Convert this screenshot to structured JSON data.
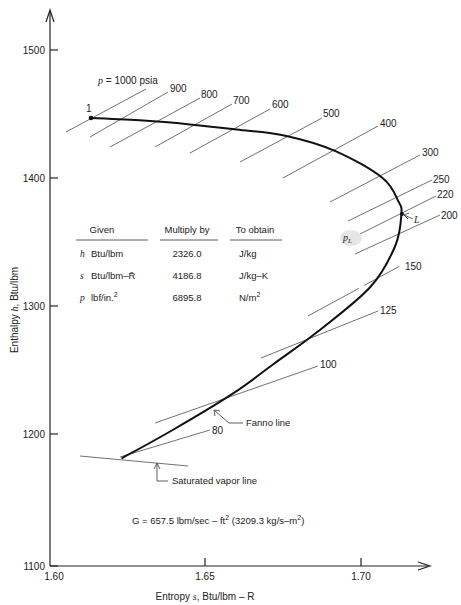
{
  "chart_data": {
    "type": "line",
    "title": "",
    "xlabel": "Entropy s, Btu/lbm – R",
    "ylabel": "Enthalpy h, Btu/lbm",
    "xlim": [
      1.6,
      1.72
    ],
    "ylim": [
      1100,
      1520
    ],
    "x_ticks": [
      1.6,
      1.65,
      1.7
    ],
    "x_tick_labels": [
      "1.60",
      "1.65",
      "1.70"
    ],
    "y_ticks": [
      1100,
      1200,
      1300,
      1400,
      1500
    ],
    "y_tick_labels": [
      "1100",
      "1200",
      "1300",
      "1400",
      "1500"
    ],
    "grid": false,
    "series": [
      {
        "name": "Fanno line",
        "points": [
          {
            "s": 1.613,
            "h": 1450
          },
          {
            "s": 1.63,
            "h": 1448
          },
          {
            "s": 1.645,
            "h": 1445
          },
          {
            "s": 1.66,
            "h": 1441
          },
          {
            "s": 1.676,
            "h": 1436
          },
          {
            "s": 1.692,
            "h": 1424
          },
          {
            "s": 1.707,
            "h": 1403
          },
          {
            "s": 1.712,
            "h": 1385
          },
          {
            "s": 1.713,
            "h": 1375
          },
          {
            "s": 1.711,
            "h": 1350
          },
          {
            "s": 1.703,
            "h": 1318
          },
          {
            "s": 1.686,
            "h": 1283
          },
          {
            "s": 1.672,
            "h": 1258
          },
          {
            "s": 1.659,
            "h": 1235
          },
          {
            "s": 1.64,
            "h": 1207
          },
          {
            "s": 1.623,
            "h": 1184
          }
        ]
      }
    ],
    "isobars_psia": [
      1000,
      900,
      800,
      700,
      600,
      500,
      400,
      300,
      250,
      220,
      200,
      150,
      125,
      100,
      80
    ],
    "isobar_lines_px": [
      {
        "label": "p = 1000 psia",
        "x1": 66,
        "y1": 132,
        "x2": 146,
        "y2": 89,
        "lx": 98,
        "ly": 84
      },
      {
        "label": "900",
        "x1": 90,
        "y1": 137,
        "x2": 168,
        "y2": 92,
        "lx": 170,
        "ly": 92
      },
      {
        "label": "800",
        "x1": 110,
        "y1": 147,
        "x2": 200,
        "y2": 98,
        "lx": 201,
        "ly": 98
      },
      {
        "label": "700",
        "x1": 155,
        "y1": 147,
        "x2": 232,
        "y2": 104,
        "lx": 233,
        "ly": 104
      },
      {
        "label": "600",
        "x1": 190,
        "y1": 153,
        "x2": 270,
        "y2": 109,
        "lx": 272,
        "ly": 108
      },
      {
        "label": "500",
        "x1": 240,
        "y1": 162,
        "x2": 322,
        "y2": 118,
        "lx": 323,
        "ly": 117
      },
      {
        "label": "400",
        "x1": 283,
        "y1": 178,
        "x2": 378,
        "y2": 126,
        "lx": 380,
        "ly": 127
      },
      {
        "label": "300",
        "x1": 330,
        "y1": 202,
        "x2": 420,
        "y2": 155,
        "lx": 422,
        "ly": 156
      },
      {
        "label": "250",
        "x1": 348,
        "y1": 221,
        "x2": 432,
        "y2": 180,
        "lx": 433,
        "ly": 183
      },
      {
        "label": "220",
        "x1": 360,
        "y1": 234,
        "x2": 436,
        "y2": 196,
        "lx": 437,
        "ly": 198
      },
      {
        "label": "200",
        "x1": 355,
        "y1": 254,
        "x2": 440,
        "y2": 215,
        "lx": 441,
        "ly": 219
      },
      {
        "label": "150",
        "x1": 308,
        "y1": 316,
        "x2": 400,
        "y2": 266,
        "lx": 405,
        "ly": 270
      },
      {
        "label": "125",
        "x1": 261,
        "y1": 358,
        "x2": 378,
        "y2": 311,
        "lx": 380,
        "ly": 314
      },
      {
        "label": "100",
        "x1": 155,
        "y1": 423,
        "x2": 318,
        "y2": 366,
        "lx": 320,
        "ly": 368
      },
      {
        "label": "80",
        "x1": 120,
        "y1": 457,
        "x2": 210,
        "y2": 430,
        "lx": 212,
        "ly": 434
      }
    ],
    "annotations": [
      {
        "text": "1",
        "s": 1.613,
        "h": 1450,
        "note": "state point 1, start of Fanno line"
      },
      {
        "text": "L",
        "s": 1.713,
        "h": 1375,
        "note": "limiting (choked) state, max entropy"
      },
      {
        "text": "p_L",
        "note": "limiting pressure isobar label"
      },
      {
        "text": "Fanno line",
        "note": "arrow to curve"
      },
      {
        "text": "Saturated vapor line",
        "note": "arrow to saturated vapor line"
      },
      {
        "text": "G = 657.5 lbm/sec – ft² (3209.3 kg/s–m²)"
      }
    ],
    "legend": null
  },
  "labels": {
    "pressure_prefix": "p",
    "pressure_main": " = 1000  psia",
    "point_1": "1",
    "point_L": "L",
    "pL_main": "p",
    "pL_sub": "L",
    "fanno_line": "Fanno line",
    "saturated_vapor_line": "Saturated vapor line",
    "mass_flux_main": "G  =  657.5  lbm/sec – ft",
    "mass_flux_sup": "2",
    "mass_flux_si": " (3209.3  kg/s–m",
    "mass_flux_si_sup": "2",
    "mass_flux_close": ")",
    "x_axis_label_pre": "Entropy ",
    "x_axis_label_var": "s",
    "x_axis_label_post": ",  Btu/lbm – R",
    "y_axis_label_pre": "Enthalpy ",
    "y_axis_label_var": "h",
    "y_axis_label_post": ",  Btu/lbm"
  },
  "conversion_table": {
    "headers": [
      "Given",
      "Multiply by",
      "To obtain"
    ],
    "rows": [
      {
        "symbol": "h",
        "given": "Btu/lbm",
        "factor": "2326.0",
        "obtain": "J/kg",
        "sup": ""
      },
      {
        "symbol": "s",
        "given": "Btu/lbm–R̄",
        "factor": "4186.8",
        "obtain": "J/kg–K",
        "sup": ""
      },
      {
        "symbol": "p",
        "given": "lbf/in.",
        "given_sup": "2",
        "factor": "6895.8",
        "obtain": "N/m",
        "obtain_sup": "2"
      }
    ]
  },
  "axes": {
    "y_ticks": [
      {
        "label": "1500",
        "py": 50
      },
      {
        "label": "1400",
        "py": 178
      },
      {
        "label": "1300",
        "py": 306
      },
      {
        "label": "1200",
        "py": 434
      },
      {
        "label": "1100",
        "py": 566
      }
    ],
    "x_ticks": [
      {
        "label": "1.60",
        "px": 50
      },
      {
        "label": "1.65",
        "px": 205
      },
      {
        "label": "1.70",
        "px": 361
      }
    ]
  }
}
